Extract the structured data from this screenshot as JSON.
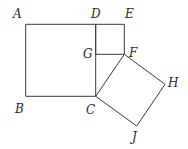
{
  "diagram": {
    "type": "geometric-figure",
    "stroke_color": "#3a3a3a",
    "points": {
      "A": {
        "label": "A",
        "x": 25.7,
        "y": 24.3
      },
      "B": {
        "label": "B",
        "x": 25.7,
        "y": 96.3
      },
      "C": {
        "label": "C",
        "x": 95.7,
        "y": 96.3
      },
      "D": {
        "label": "D",
        "x": 95.7,
        "y": 24.3
      },
      "E": {
        "label": "E",
        "x": 124.3,
        "y": 24.3
      },
      "F": {
        "label": "F",
        "x": 124.3,
        "y": 54.3
      },
      "G": {
        "label": "G",
        "x": 95.7,
        "y": 54.3
      },
      "H": {
        "label": "H",
        "x": 165.0,
        "y": 84.3
      },
      "J": {
        "label": "J",
        "x": 136.7,
        "y": 126.0
      }
    },
    "shapes": [
      {
        "name": "square-ABCD",
        "vertices": [
          "A",
          "D",
          "C",
          "B"
        ]
      },
      {
        "name": "square-DEFG",
        "vertices": [
          "D",
          "E",
          "F",
          "G"
        ]
      },
      {
        "name": "square-CFHJ",
        "vertices": [
          "C",
          "F",
          "H",
          "J"
        ]
      }
    ]
  }
}
